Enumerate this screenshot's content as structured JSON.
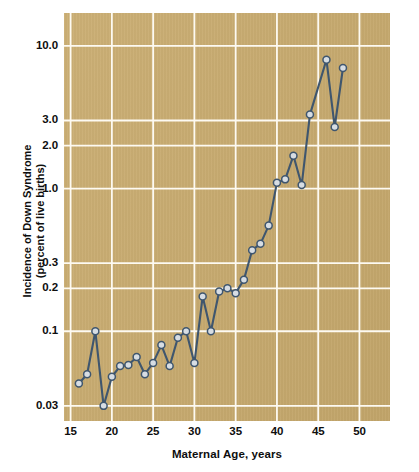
{
  "chart_data": {
    "type": "line",
    "title": "",
    "xlabel": "Maternal Age, years",
    "ylabel_line1": "Incidence of Down Syndrome",
    "ylabel_line2": "(percent of live births)",
    "yscale": "log",
    "xlim": [
      14.2,
      53.7
    ],
    "ylim": [
      0.0235,
      17.0
    ],
    "grid": true,
    "legend": "none",
    "xticks": [
      15,
      20,
      25,
      30,
      35,
      40,
      45,
      50
    ],
    "xtick_labels": [
      "15",
      "20",
      "25",
      "30",
      "35",
      "40",
      "45",
      "50"
    ],
    "yticks": [
      0.03,
      0.1,
      0.2,
      0.3,
      1.0,
      2.0,
      3.0,
      10.0
    ],
    "ytick_labels": [
      "0.03",
      "0.1",
      "0.2",
      "0.3",
      "1.0",
      "2.0",
      "3.0",
      "10.0"
    ],
    "x": [
      16,
      17,
      18,
      19,
      20,
      21,
      22,
      23,
      24,
      25,
      26,
      27,
      28,
      29,
      30,
      31,
      32,
      33,
      34,
      35,
      36,
      37,
      38,
      39,
      40,
      41,
      42,
      43,
      44,
      46,
      47,
      48
    ],
    "values": [
      0.043,
      0.05,
      0.1,
      0.03,
      0.048,
      0.057,
      0.058,
      0.066,
      0.05,
      0.06,
      0.08,
      0.057,
      0.09,
      0.1,
      0.06,
      0.175,
      0.1,
      0.19,
      0.2,
      0.185,
      0.23,
      0.37,
      0.41,
      0.55,
      1.1,
      1.16,
      1.7,
      1.06,
      3.3,
      8.0,
      2.7,
      7.0
    ],
    "series": [
      {
        "name": "Incidence of Down Syndrome",
        "points": [
          {
            "x": 16,
            "y": 0.043
          },
          {
            "x": 17,
            "y": 0.05
          },
          {
            "x": 18,
            "y": 0.1
          },
          {
            "x": 19,
            "y": 0.03
          },
          {
            "x": 20,
            "y": 0.048
          },
          {
            "x": 21,
            "y": 0.057
          },
          {
            "x": 22,
            "y": 0.058
          },
          {
            "x": 23,
            "y": 0.066
          },
          {
            "x": 24,
            "y": 0.05
          },
          {
            "x": 25,
            "y": 0.06
          },
          {
            "x": 26,
            "y": 0.08
          },
          {
            "x": 27,
            "y": 0.057
          },
          {
            "x": 28,
            "y": 0.09
          },
          {
            "x": 29,
            "y": 0.1
          },
          {
            "x": 30,
            "y": 0.06
          },
          {
            "x": 31,
            "y": 0.175
          },
          {
            "x": 32,
            "y": 0.1
          },
          {
            "x": 33,
            "y": 0.19
          },
          {
            "x": 34,
            "y": 0.2
          },
          {
            "x": 35,
            "y": 0.185
          },
          {
            "x": 36,
            "y": 0.23
          },
          {
            "x": 37,
            "y": 0.37
          },
          {
            "x": 38,
            "y": 0.41
          },
          {
            "x": 39,
            "y": 0.55
          },
          {
            "x": 40,
            "y": 1.1
          },
          {
            "x": 41,
            "y": 1.16
          },
          {
            "x": 42,
            "y": 1.7
          },
          {
            "x": 43,
            "y": 1.06
          },
          {
            "x": 44,
            "y": 3.3
          },
          {
            "x": 46,
            "y": 8.0
          },
          {
            "x": 47,
            "y": 2.7
          },
          {
            "x": 48,
            "y": 7.0
          }
        ]
      }
    ],
    "colors": {
      "plot_background": "#c9ab6e",
      "gridline": "#fdfaf2",
      "line": "#3f566e",
      "marker_fill": "#d7dde3",
      "text": "#0e0e0e",
      "page_background": "#ffffff"
    }
  }
}
